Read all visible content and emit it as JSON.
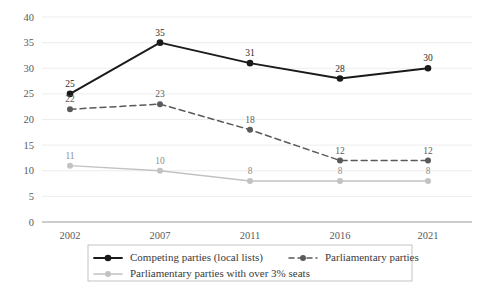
{
  "chart_data": {
    "type": "line",
    "title": "",
    "subtitle": "",
    "xlabel": "",
    "ylabel": "",
    "categories": [
      "2002",
      "2007",
      "2011",
      "2016",
      "2021"
    ],
    "x": [
      2002,
      2007,
      2011,
      2016,
      2021
    ],
    "ylim": [
      0,
      40
    ],
    "yticks": [
      0,
      5,
      10,
      15,
      20,
      25,
      30,
      35,
      40
    ],
    "ytick_labels": [
      "0",
      "5",
      "10",
      "15",
      "20",
      "25",
      "30",
      "35",
      "40"
    ],
    "xtick_labels": [
      "2002",
      "2007",
      "2011",
      "2016",
      "2021"
    ],
    "grid": true,
    "grid_axis": "y",
    "legend_position": "bottom",
    "data_labels": true,
    "series": [
      {
        "name": "Competing parties (local lists)",
        "values": [
          25,
          35,
          31,
          28,
          30
        ],
        "value_labels": [
          "25",
          "35",
          "31",
          "28",
          "30"
        ],
        "color": "#1a1a1a",
        "style": "solid",
        "marker": "circle"
      },
      {
        "name": "Parliamentary parties",
        "values": [
          22,
          23,
          18,
          12,
          12
        ],
        "value_labels": [
          "22",
          "23",
          "18",
          "12",
          "12"
        ],
        "color": "#5a5a5a",
        "style": "dashed",
        "marker": "circle"
      },
      {
        "name": "Parliamentary parties with over 3% seats",
        "values": [
          11,
          10,
          8,
          8,
          8
        ],
        "value_labels": [
          "11",
          "10",
          "8",
          "8",
          "8"
        ],
        "color": "#c2c2c2",
        "style": "solid",
        "marker": "circle"
      }
    ]
  },
  "legend": {
    "entries": [
      {
        "label": "Competing parties (local lists)"
      },
      {
        "label": "Parliamentary parties"
      },
      {
        "label": "Parliamentary parties with over 3% seats"
      }
    ]
  },
  "colors": {
    "series_1": "#1a1a1a",
    "series_2": "#5a5a5a",
    "series_3": "#c2c2c2",
    "grid": "#e9e9e9",
    "axis": "#9a9a9a",
    "legend_border": "#b5b5b5",
    "background": "#ffffff"
  }
}
